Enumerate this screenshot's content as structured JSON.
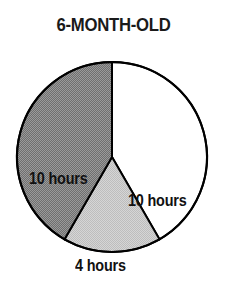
{
  "chart_data": {
    "type": "pie",
    "title": "6-MONTH-OLD",
    "subtitle": "",
    "xlabel": "",
    "ylabel": "",
    "total": 24,
    "units": "hours",
    "legend_position": "none",
    "grid": false,
    "slices": [
      {
        "name": "white-slice",
        "label": "10 hours",
        "value": 10,
        "start_angle": 0,
        "end_angle": 150,
        "fill": "#ffffff",
        "pattern": "none",
        "stroke": "#000000"
      },
      {
        "name": "light-gray-slice",
        "label": "4 hours",
        "value": 4,
        "start_angle": 150,
        "end_angle": 210,
        "fill": "#c9c9c9",
        "pattern": "dither-light",
        "stroke": "#000000"
      },
      {
        "name": "dark-gray-slice",
        "label": "10 hours",
        "value": 10,
        "start_angle": 210,
        "end_angle": 360,
        "fill": "#7d7d7d",
        "pattern": "dither-dark",
        "stroke": "#000000"
      }
    ],
    "categories": [
      "10 hours",
      "4 hours",
      "10 hours"
    ],
    "values": [
      10,
      4,
      10
    ]
  },
  "geometry": {
    "center_x": 112,
    "center_y": 109,
    "radius": 95
  },
  "colors": {
    "outline": "#000000",
    "title_color": "#1a1a1a",
    "label_color": "#111111",
    "background": "#ffffff"
  }
}
